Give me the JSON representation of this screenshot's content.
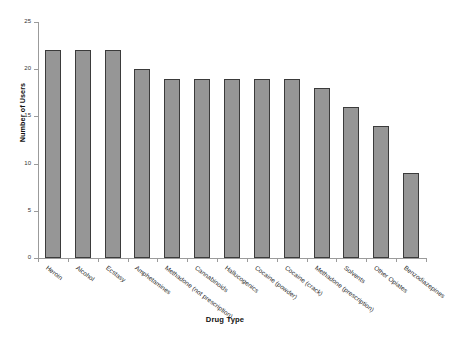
{
  "chart_data": {
    "type": "bar",
    "title": "",
    "xlabel": "Drug Type",
    "ylabel": "Number of Users",
    "ylim": [
      0,
      25
    ],
    "ytick_values": [
      0,
      5,
      10,
      15,
      20,
      25
    ],
    "ytick_labels": [
      "0",
      "5",
      "10",
      "15",
      "20",
      "25"
    ],
    "grid": false,
    "legend": null,
    "bar_color": "#969696",
    "bar_edge_color": "#3b3b3b",
    "axis_color": "#9b9b9b",
    "categories": [
      "Heroin",
      "Alcohol",
      "Ecstasy",
      "Amphetamines",
      "Methadone (not prescription)",
      "Cannabinoids",
      "Hallucogenics",
      "Cocaine (powder)",
      "Cocaine (crack)",
      "Methadone (prescription)",
      "Solvents",
      "Other Opiates",
      "Benzodiazepines"
    ],
    "values": [
      22,
      22,
      22,
      20,
      19,
      19,
      19,
      19,
      19,
      18,
      16,
      14,
      9
    ]
  }
}
